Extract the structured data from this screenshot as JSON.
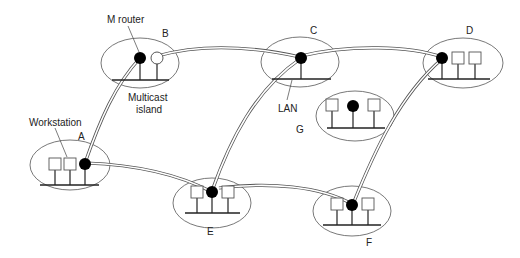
{
  "diagram": {
    "labels": {
      "m_router": "M router",
      "multicast_line1": "Multicast",
      "multicast_line2": "island",
      "workstation": "Workstation",
      "lan": "LAN"
    },
    "islands": [
      {
        "id": "A",
        "label": "A"
      },
      {
        "id": "B",
        "label": "B"
      },
      {
        "id": "C",
        "label": "C"
      },
      {
        "id": "D",
        "label": "D"
      },
      {
        "id": "E",
        "label": "E"
      },
      {
        "id": "F",
        "label": "F"
      },
      {
        "id": "G",
        "label": "G"
      }
    ],
    "tunnels": [
      {
        "from": "A",
        "to": "B"
      },
      {
        "from": "B",
        "to": "C"
      },
      {
        "from": "C",
        "to": "D"
      },
      {
        "from": "A",
        "to": "E"
      },
      {
        "from": "E",
        "to": "C"
      },
      {
        "from": "E",
        "to": "F"
      },
      {
        "from": "F",
        "to": "D"
      }
    ],
    "colors": {
      "router": "#000000",
      "outline": "#555555",
      "background": "#ffffff"
    }
  }
}
